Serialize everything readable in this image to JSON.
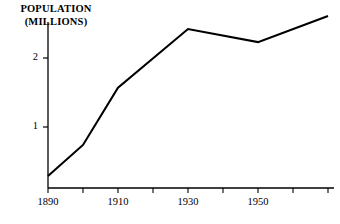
{
  "chart_data": {
    "type": "line",
    "title": "",
    "ylabel_line1": "POPULATION",
    "ylabel_line2": "(MILLIONS)",
    "xlabel": "",
    "x": [
      1890,
      1900,
      1910,
      1930,
      1950,
      1970
    ],
    "values": [
      0.29,
      0.74,
      1.57,
      2.42,
      2.23,
      2.61
    ],
    "series": [
      {
        "name": "Population (millions)",
        "values": [
          0.29,
          0.74,
          1.57,
          2.42,
          2.23,
          2.61
        ]
      }
    ],
    "xtick_labels": [
      "1890",
      "1910",
      "1930",
      "1950"
    ],
    "xtick_values": [
      1890,
      1910,
      1930,
      1950
    ],
    "xtick_all_values": [
      1890,
      1900,
      1910,
      1920,
      1930,
      1940,
      1950,
      1960,
      1970
    ],
    "ytick_labels": [
      "1",
      "2"
    ],
    "ytick_values": [
      1,
      2
    ],
    "xlim": [
      1890,
      1970
    ],
    "ylim": [
      0.116,
      2.72
    ],
    "grid": false,
    "legend": false,
    "line_color": "#000000",
    "axis_color": "#000000",
    "background_color": "#ffffff"
  },
  "axis_title": {
    "line1": "POPULATION",
    "line2": "(MILLIONS)"
  },
  "ytick_labels": [
    {
      "text": "2",
      "top": 51
    },
    {
      "text": "1",
      "top": 120
    }
  ],
  "xtick_labels": [
    {
      "text": "1890",
      "left": 30
    },
    {
      "text": "1910",
      "left": 100
    },
    {
      "text": "1930",
      "left": 170
    },
    {
      "text": "1950",
      "left": 240
    }
  ]
}
